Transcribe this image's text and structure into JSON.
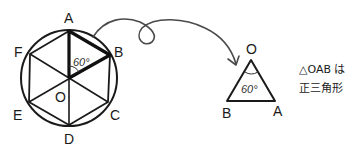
{
  "hexagon": {
    "vertices": {
      "A": "A",
      "B": "B",
      "C": "C",
      "D": "D",
      "E": "E",
      "F": "F"
    },
    "center": "O",
    "angle_label": "60°"
  },
  "triangle": {
    "vertices": {
      "O": "O",
      "B": "B",
      "A": "A"
    },
    "angle_label": "60°"
  },
  "note": {
    "line1": "△OAB は",
    "line2": "正三角形"
  },
  "colors": {
    "ink": "#1a1a1a",
    "arrow": "#4a4a4a"
  }
}
